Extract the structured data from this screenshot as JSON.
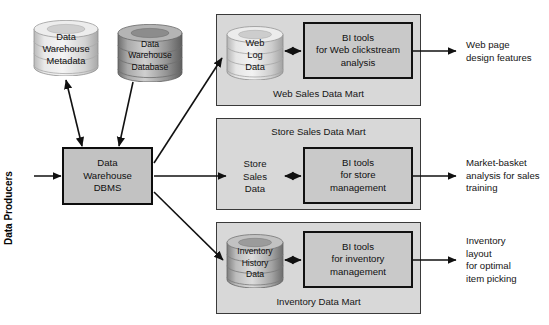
{
  "figure": {
    "kind": "data-warehouse-architecture-diagram",
    "background": "#ffffff"
  },
  "colors": {
    "mart_panel_fill": "#d8d8d8",
    "mart_panel_border": "#3a3a3a",
    "bi_box_fill": "#c9c9c9",
    "bi_box_border": "#111111",
    "dbms_fill": "#c2c2c2",
    "dbms_border": "#0d0d0d",
    "cylinder_light": "#d5d5d5",
    "cylinder_dark": "#8a8a8a",
    "arrow": "#111111",
    "text": "#151515"
  },
  "left": {
    "producers_label": "Data Producers",
    "metadata_store": {
      "line1": "Data",
      "line2": "Warehouse",
      "line3": "Metadata",
      "shade": "light"
    },
    "warehouse_db": {
      "line1": "Data",
      "line2": "Warehouse",
      "line3": "Database",
      "shade": "dark"
    },
    "dbms": {
      "line1": "Data",
      "line2": "Warehouse",
      "line3": "DBMS"
    }
  },
  "marts": [
    {
      "id": "web-sales-data-mart",
      "title": "Web Sales Data Mart",
      "title_position": "bottom",
      "store": {
        "type": "cylinder",
        "shade": "light",
        "line1": "Web",
        "line2": "Log",
        "line3": "Data"
      },
      "bi_tool": {
        "line1": "BI tools",
        "line2": "for Web clickstream",
        "line3": "analysis"
      },
      "output": {
        "line1": "Web page",
        "line2": "design features"
      }
    },
    {
      "id": "store-sales-data-mart",
      "title": "Store Sales Data Mart",
      "title_position": "top",
      "store": {
        "type": "text",
        "line1": "Store",
        "line2": "Sales",
        "line3": "Data"
      },
      "bi_tool": {
        "line1": "BI tools",
        "line2": "for store",
        "line3": "management"
      },
      "output": {
        "line1": "Market-basket",
        "line2": "analysis for sales",
        "line3": "training"
      }
    },
    {
      "id": "inventory-data-mart",
      "title": "Inventory Data Mart",
      "title_position": "bottom",
      "store": {
        "type": "cylinder",
        "shade": "dark",
        "line1": "Inventory",
        "line2": "History",
        "line3": "Data"
      },
      "bi_tool": {
        "line1": "BI tools",
        "line2": "for inventory",
        "line3": "management"
      },
      "output": {
        "line1": "Inventory",
        "line2": "layout",
        "line3": "for optimal",
        "line4": "item picking"
      }
    }
  ],
  "connectors": [
    {
      "id": "producers-to-dbms",
      "style": "single-arrow"
    },
    {
      "id": "dbms-to-metadata",
      "style": "double-arrow"
    },
    {
      "id": "warehouse-db-to-dbms",
      "style": "single-arrow"
    },
    {
      "id": "dbms-to-web-mart",
      "style": "single-arrow"
    },
    {
      "id": "dbms-to-store-mart",
      "style": "single-arrow"
    },
    {
      "id": "dbms-to-inventory-mart",
      "style": "single-arrow"
    },
    {
      "id": "web-store-to-bi",
      "style": "double-arrow"
    },
    {
      "id": "store-store-to-bi",
      "style": "double-arrow"
    },
    {
      "id": "inventory-store-to-bi",
      "style": "double-arrow"
    },
    {
      "id": "web-bi-to-output",
      "style": "single-arrow"
    },
    {
      "id": "store-bi-to-output",
      "style": "single-arrow"
    },
    {
      "id": "inventory-bi-to-output",
      "style": "single-arrow"
    }
  ]
}
